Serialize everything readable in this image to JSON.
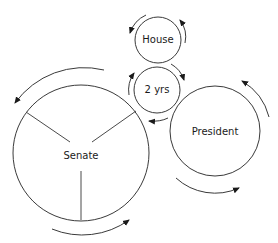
{
  "diagram": {
    "nodes": [
      {
        "id": "house",
        "label": "House"
      },
      {
        "id": "term",
        "label": "2 yrs"
      },
      {
        "id": "senate",
        "label": "Senate"
      },
      {
        "id": "president",
        "label": "President"
      }
    ],
    "colors": {
      "stroke": "#3a3a3a",
      "text": "#1a1a1a",
      "background": "#ffffff"
    }
  }
}
